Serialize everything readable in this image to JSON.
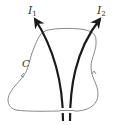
{
  "diagram": {
    "type": "ampere-loop",
    "currents": [
      {
        "id": "I1",
        "symbol": "I",
        "subscript": "1"
      },
      {
        "id": "I2",
        "symbol": "I",
        "subscript": "2"
      }
    ],
    "loop": {
      "label": "C"
    },
    "colors": {
      "wire": "#1a1a1a",
      "loop": "#8a8a8a",
      "text": "#333333"
    }
  }
}
